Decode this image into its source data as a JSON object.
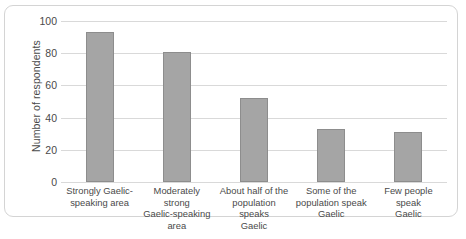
{
  "chart_data": {
    "type": "bar",
    "title": "",
    "xlabel": "",
    "ylabel": "Number of respondents",
    "ylim": [
      0,
      100
    ],
    "ytick_values": [
      0,
      20,
      40,
      60,
      80,
      100
    ],
    "ytick_labels": [
      "0",
      "20",
      "40",
      "60",
      "80",
      "100"
    ],
    "grid": true,
    "legend": "none",
    "categories": [
      "Strongly Gaelic-speaking area",
      "Moderately strong Gaelic-speaking area",
      "About half of the population speaks Gaelic",
      "Some of the population speak Gaelic",
      "Few people speak Gaelic"
    ],
    "category_label_lines": [
      [
        "Strongly Gaelic-",
        "speaking area"
      ],
      [
        "Moderately strong",
        "Gaelic-speaking area"
      ],
      [
        "About half of the",
        "population speaks",
        "Gaelic"
      ],
      [
        "Some of the",
        "population speak",
        "Gaelic"
      ],
      [
        "Few people speak",
        "Gaelic"
      ]
    ],
    "values": [
      93,
      81,
      52,
      33,
      31
    ],
    "bar_color": "#a5a5a5",
    "bar_border_color": "#8d8d8d",
    "gridline_color": "#d9d9d9",
    "text_color": "#4a4a4a",
    "frame_border_color": "#d4d4d4"
  },
  "caption_remnant": ""
}
